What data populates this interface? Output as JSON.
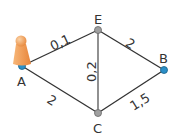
{
  "diagram": {
    "type": "weighted-graph",
    "nodes": [
      {
        "id": "A",
        "label": "A",
        "x": 22,
        "y": 66,
        "color": "#2a8fc7"
      },
      {
        "id": "E",
        "label": "E",
        "x": 98,
        "y": 30,
        "color": "#9a9a9a"
      },
      {
        "id": "B",
        "label": "B",
        "x": 164,
        "y": 70,
        "color": "#2a8fc7"
      },
      {
        "id": "C",
        "label": "C",
        "x": 98,
        "y": 113,
        "color": "#9a9a9a"
      }
    ],
    "edges": [
      {
        "from": "A",
        "to": "E",
        "weight": "0,1"
      },
      {
        "from": "E",
        "to": "B",
        "weight": "2"
      },
      {
        "from": "A",
        "to": "C",
        "weight": "2"
      },
      {
        "from": "E",
        "to": "C",
        "weight": "0,2"
      },
      {
        "from": "C",
        "to": "B",
        "weight": "1,5"
      }
    ],
    "token": {
      "at": "A",
      "color": "#f0a050",
      "shape": "game-pawn"
    }
  }
}
